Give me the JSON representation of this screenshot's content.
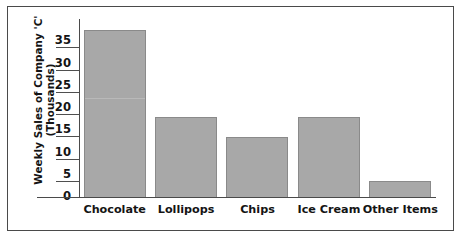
{
  "chart_data": {
    "type": "bar",
    "title": "",
    "subtitle": "",
    "xlabel": "",
    "ylabel_lines": [
      "Weekly Sales of Company 'C'",
      "(Thousands)"
    ],
    "ylabel": "Weekly Sales of Company 'C' (Thousands)",
    "categories": [
      "Chocolate",
      "Lollipops",
      "Chips",
      "Ice Cream",
      "Other Items"
    ],
    "values": [
      37.5,
      18,
      13.5,
      18,
      3.7
    ],
    "ylim": [
      0,
      40
    ],
    "yticks": [
      0,
      5,
      10,
      15,
      20,
      25,
      30,
      35
    ],
    "ytick_labels": [
      "0",
      "5",
      "10",
      "15",
      "20",
      "25",
      "30",
      "35"
    ],
    "grid": false,
    "legend": null,
    "legend_position": "none",
    "annotations": [],
    "colors": {
      "bar_fill": "#a8a8a8",
      "bar_border": "#8a8a8a",
      "axis": "#4a4a4a",
      "text": "#141414",
      "background": "#ffffff",
      "frame_border": "#4a4a4a"
    }
  }
}
